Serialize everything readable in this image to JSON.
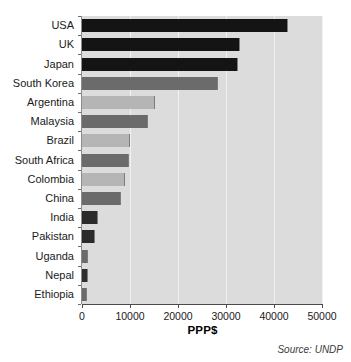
{
  "chart_data": {
    "type": "bar",
    "orientation": "horizontal",
    "title": "",
    "xlabel": "PPP$",
    "ylabel": "",
    "xlim": [
      0,
      50000
    ],
    "xticks": [
      0,
      10000,
      20000,
      30000,
      40000,
      50000
    ],
    "xtick_labels": [
      "0",
      "10000",
      "20000",
      "30000",
      "40000",
      "50000"
    ],
    "grid": true,
    "legend": null,
    "categories": [
      "USA",
      "UK",
      "Japan",
      "South Korea",
      "Argentina",
      "Malaysia",
      "Brazil",
      "South Africa",
      "Colombia",
      "China",
      "India",
      "Pakistan",
      "Uganda",
      "Nepal",
      "Ethiopia"
    ],
    "values": [
      43000,
      33000,
      32500,
      28300,
      15200,
      13700,
      10000,
      9800,
      9000,
      8100,
      3300,
      2700,
      1200,
      1300,
      1000
    ],
    "bar_colors": [
      "#141414",
      "#141414",
      "#141414",
      "#6b6b6b",
      "#b5b5b5",
      "#6b6b6b",
      "#b5b5b5",
      "#6b6b6b",
      "#b5b5b5",
      "#6b6b6b",
      "#2b2b2b",
      "#2b2b2b",
      "#6b6b6b",
      "#2f2f2f",
      "#6b6b6b"
    ],
    "plot_background": "#dcdcdc",
    "gridline_color": "#f2f2f2"
  },
  "source_note": "Source: UNDP"
}
